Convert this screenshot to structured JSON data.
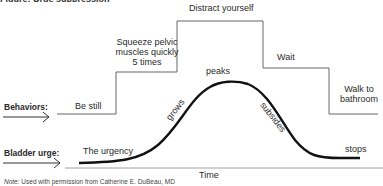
{
  "title_partial": "Figure: Urge suppression",
  "behaviors": {
    "row_label": "Behaviors:",
    "steps": [
      {
        "label": "Be still"
      },
      {
        "label": "Squeeze pelvic\nmuscles quickly\n5 times",
        "lines": [
          "Squeeze pelvic",
          "muscles quickly",
          "5 times"
        ]
      },
      {
        "label": "Distract yourself"
      },
      {
        "label": "Wait"
      },
      {
        "label": "Walk to bathroom",
        "lines": [
          "Walk to",
          "bathroom"
        ]
      }
    ]
  },
  "urge": {
    "row_label": "Bladder urge:",
    "phases": {
      "start": "The urgency",
      "rise": "grows",
      "top": "peaks",
      "fall": "subsides",
      "end": "stops"
    }
  },
  "axis": {
    "xlabel": "Time"
  },
  "note": {
    "prefix": "Note:",
    "text": " Used with permission from Catherine E. DuBeau, MD"
  },
  "colors": {
    "line": "#555555",
    "curve": "#111111",
    "text": "#2a2a2a"
  }
}
